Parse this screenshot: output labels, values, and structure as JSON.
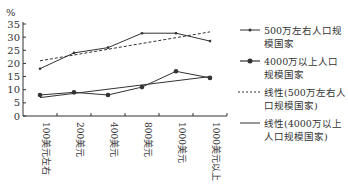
{
  "chart_data": {
    "type": "line",
    "title": "",
    "xlabel": "",
    "ylabel": "%",
    "ylim": [
      0,
      35
    ],
    "yticks": [
      0,
      5,
      10,
      15,
      20,
      25,
      30,
      35
    ],
    "categories": [
      "100美元左右",
      "200美元",
      "400美元",
      "800美元",
      "1000美元",
      "1000美元以上"
    ],
    "series": [
      {
        "name": "500万左右人口规模国家",
        "style": "solid-marker-small",
        "values": [
          18,
          24,
          26,
          31.5,
          31.5,
          28.5
        ]
      },
      {
        "name": "4000万以上人口规模国家",
        "style": "solid-marker-large",
        "values": [
          8,
          9,
          8,
          11,
          17,
          14.5
        ]
      },
      {
        "name": "线性(500万左右人口规模国家)",
        "style": "dashed",
        "values": [
          21,
          23.2,
          25.4,
          27.6,
          29.8,
          32
        ]
      },
      {
        "name": "线性(4000万以上人口规模国家)",
        "style": "solid",
        "values": [
          7,
          8.6,
          10.2,
          11.8,
          13.4,
          15
        ]
      }
    ],
    "grid": false,
    "legend_position": "right"
  },
  "legend": {
    "items": [
      {
        "label": "500万左右人口规模国家"
      },
      {
        "label": "4000万以上人口规模国家"
      },
      {
        "label": "线性(500万左右人口规模国家)"
      },
      {
        "label": "线性(4000万以上人口规模国家)"
      }
    ]
  }
}
